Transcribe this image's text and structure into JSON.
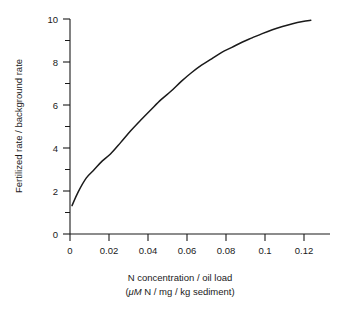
{
  "chart_data": {
    "type": "line",
    "title": "",
    "xlabel": "N concentration / oil load",
    "xlabel_units": "(μM N / mg / kg sediment)",
    "xlabel_units_italic_part": "μM",
    "xlabel_units_rest": " N / mg / kg sediment)",
    "xlabel_units_open": "(",
    "ylabel": "Fertilized rate / background rate",
    "xlim": [
      0,
      0.1285
    ],
    "ylim": [
      0,
      10
    ],
    "grid": false,
    "legend": null,
    "x_ticks": [
      0,
      0.02,
      0.04,
      0.06,
      0.08,
      0.1,
      0.12
    ],
    "x_tick_labels": [
      "0",
      "0.02",
      "0.04",
      "0.06",
      "0.08",
      "0.1",
      "0.12"
    ],
    "y_ticks": [
      0,
      2,
      4,
      6,
      8,
      10
    ],
    "y_tick_labels": [
      "0",
      "2",
      "4",
      "6",
      "8",
      "10"
    ],
    "y_minor_ticks": [
      1,
      3,
      5,
      7,
      9
    ],
    "series": [
      {
        "name": "fertilized rate ratio",
        "color": "#1a1a1a",
        "x": [
          0.001,
          0.004,
          0.008,
          0.012,
          0.016,
          0.02,
          0.025,
          0.03,
          0.035,
          0.04,
          0.045,
          0.05,
          0.055,
          0.06,
          0.065,
          0.07,
          0.075,
          0.08,
          0.085,
          0.09,
          0.095,
          0.1,
          0.105,
          0.11,
          0.115,
          0.119
        ],
        "y": [
          1.32,
          1.95,
          2.6,
          3.0,
          3.4,
          3.72,
          4.25,
          4.8,
          5.3,
          5.78,
          6.25,
          6.65,
          7.1,
          7.5,
          7.85,
          8.15,
          8.45,
          8.68,
          8.92,
          9.12,
          9.32,
          9.5,
          9.65,
          9.78,
          9.88,
          9.94
        ]
      }
    ]
  },
  "axes_geometry": {
    "plot_left_px": 70,
    "plot_bottom_px": 234,
    "plot_top_px": 19,
    "x_axis_right_px": 330,
    "px_per_x_unit": 1958.0,
    "px_per_y_unit": 21.5
  }
}
